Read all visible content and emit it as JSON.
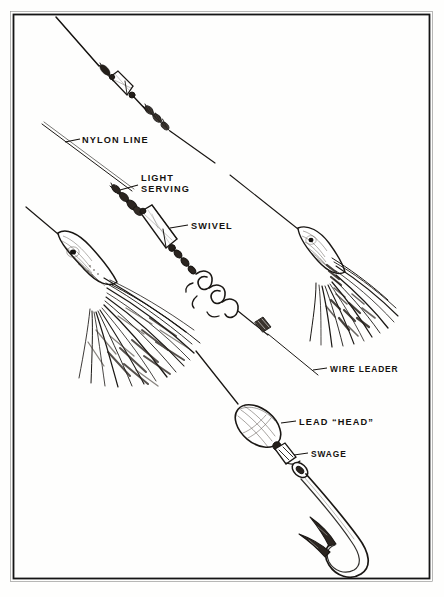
{
  "figure": {
    "medium": "pen-and-ink line drawing",
    "background_color": "#ffffff",
    "ink_color": "#1a1714",
    "border": {
      "present": true,
      "color": "#141414",
      "inset_px": 12
    },
    "labels": [
      {
        "id": "nylon-line",
        "text": "NYLON LINE",
        "x": 84,
        "y": 143,
        "leader_from": [
          82,
          140
        ],
        "leader_to": [
          64,
          146
        ]
      },
      {
        "id": "light-serving",
        "text": "LIGHT",
        "text2": "SERVING",
        "x": 142,
        "y": 180,
        "leader_from": [
          138,
          188
        ],
        "leader_to": [
          118,
          191
        ]
      },
      {
        "id": "swivel",
        "text": "SWIVEL",
        "x": 192,
        "y": 227,
        "leader_from": [
          189,
          224
        ],
        "leader_to": [
          168,
          228
        ]
      },
      {
        "id": "wire-leader",
        "text": "WIRE LEADER",
        "x": 330,
        "y": 372,
        "leader_from": [
          327,
          369
        ],
        "leader_to": [
          312,
          369
        ]
      },
      {
        "id": "lead-head",
        "text": "LEAD “HEAD”",
        "x": 299,
        "y": 425,
        "leader_from": [
          296,
          422
        ],
        "leader_to": [
          280,
          423
        ]
      },
      {
        "id": "swage",
        "text": "SWAGE",
        "x": 311,
        "y": 456,
        "leader_from": [
          308,
          453
        ],
        "leader_to": [
          293,
          455
        ]
      }
    ],
    "components": [
      {
        "id": "nylon-line",
        "name": "Nylon line",
        "count": 3
      },
      {
        "id": "light-serving",
        "name": "Light serving",
        "count": 2
      },
      {
        "id": "swivel",
        "name": "Barrel swivel",
        "count": 2
      },
      {
        "id": "wire-leader",
        "name": "Wire leader",
        "count": 2
      },
      {
        "id": "haywire-twist",
        "name": "Haywire twist loop",
        "count": 1
      },
      {
        "id": "feather-lure",
        "name": "Feather / squid skirt lure",
        "count": 2
      },
      {
        "id": "lead-head",
        "name": "Lead head",
        "count": 1
      },
      {
        "id": "swage",
        "name": "Swage sleeve",
        "count": 1
      },
      {
        "id": "hook",
        "name": "Barbed J hook",
        "count": 1
      }
    ]
  }
}
